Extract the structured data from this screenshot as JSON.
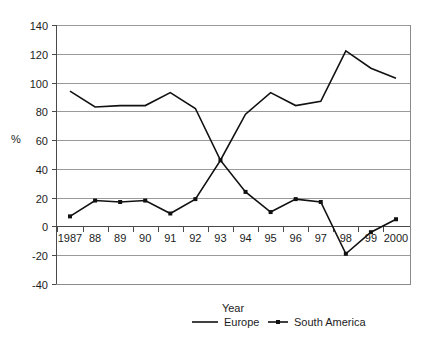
{
  "chart_data": {
    "type": "line",
    "title": "",
    "xlabel": "Year",
    "ylabel": "%",
    "categories": [
      "1987",
      "88",
      "89",
      "90",
      "91",
      "92",
      "93",
      "94",
      "95",
      "96",
      "97",
      "98",
      "99",
      "2000"
    ],
    "x_tick_labels": [
      "1987",
      "88",
      "89",
      "90",
      "91",
      "92",
      "93",
      "94",
      "95",
      "96",
      "97",
      "98",
      "99",
      "2000"
    ],
    "y_tick_labels": [
      "140",
      "120",
      "100",
      "80",
      "60",
      "40",
      "20",
      "0",
      "-20",
      "-40"
    ],
    "y_ticks": [
      140,
      120,
      100,
      80,
      60,
      40,
      20,
      0,
      -20,
      -40
    ],
    "ylim": [
      -40,
      140
    ],
    "grid": true,
    "legend_position": "bottom",
    "series": [
      {
        "name": "Europe",
        "marker": "none",
        "color": "#111111",
        "values": [
          94,
          83,
          84,
          84,
          93,
          82,
          46,
          78,
          93,
          84,
          87,
          122,
          110,
          103
        ]
      },
      {
        "name": "South America",
        "marker": "square",
        "color": "#111111",
        "values": [
          7,
          18,
          17,
          18,
          9,
          19,
          46,
          24,
          10,
          19,
          17,
          -19,
          -4,
          5
        ]
      }
    ]
  },
  "axis": {
    "y_label": "%",
    "x_label": "Year"
  },
  "legend": {
    "items": [
      {
        "label": "Europe",
        "marker": "none"
      },
      {
        "label": "South America",
        "marker": "square"
      }
    ]
  }
}
